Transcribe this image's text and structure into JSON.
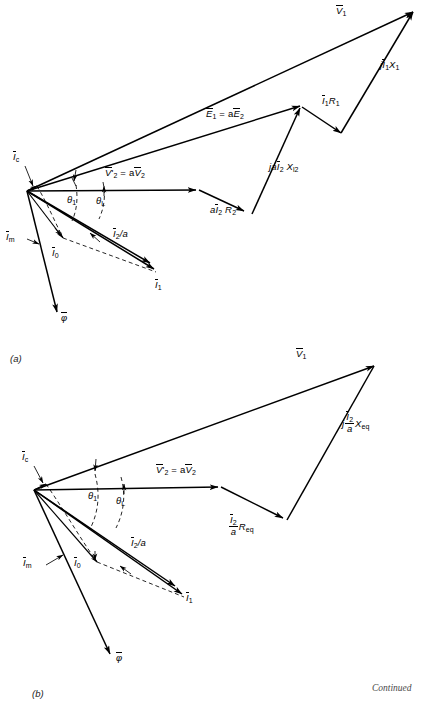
{
  "figure": {
    "background_color": "#ffffff",
    "line_color": "#000000",
    "width": 423,
    "height": 707,
    "continued_note": "Continued"
  },
  "captions": {
    "a": "(a)",
    "b": "(b)"
  },
  "diagram_a": {
    "caption": "(a)",
    "labels": {
      "v1": "V̄1",
      "ji1x1": "jĪ1X1",
      "i1r1": "Ī1R1",
      "e1_ae2": "Ē₁ = aĒ₂",
      "jai2xl2": "jaĪ₂ Xₗ₂",
      "ai2r2": "aĪ₂R₂",
      "v2p_av2": "V̄'₂ = aV̄₂",
      "ic": "Īc",
      "im": "Īm",
      "i0": "Ī0",
      "i1": "Ī1",
      "i2_over_a": "Ī₂/a",
      "theta1": "θ1",
      "thetaL": "θL",
      "phi": "φ̄"
    }
  },
  "diagram_b": {
    "caption": "(b)",
    "labels": {
      "v1": "V̄1",
      "j_i2_a_xeq": "j (Ī₂/a) Xeq",
      "i2_a_req": "(Ī₂/a) Req",
      "v2p_av2": "V̄'₂ = aV̄₂",
      "ic": "Īc",
      "im": "Īm",
      "i0": "Ī0",
      "i1": "Ī1",
      "i2_over_a": "Ī₂/a",
      "theta1": "θ1",
      "thetaL": "θL",
      "phi": "φ̄"
    }
  },
  "label_text": {
    "a_v1": "V",
    "a_v1_sub": "1",
    "a_ji1x1_j": "j",
    "a_ji1x1_i": "I",
    "a_ji1x1_isub": "1",
    "a_ji1x1_x": "X",
    "a_ji1x1_xsub": "1",
    "a_i1r1_i": "I",
    "a_i1r1_isub": "1",
    "a_i1r1_r": "R",
    "a_i1r1_rsub": "1",
    "a_e1_e": "E",
    "a_e1_esub": "1",
    "a_e1_eq": " = a",
    "a_e1_e2": "E",
    "a_e1_e2sub": "2",
    "a_xl2_ja": "ja",
    "a_xl2_i": "I",
    "a_xl2_isub": "2",
    "a_xl2_x": " X",
    "a_xl2_xsub": "l2",
    "a_r2_a": "a",
    "a_r2_i": "I",
    "a_r2_isub": "2",
    "a_r2_r": " R",
    "a_r2_rsub": "2",
    "a_v2p_v": "V",
    "a_v2p_prime": "'",
    "a_v2p_sub": "2",
    "a_v2p_eq": " = a",
    "a_v2p_v2": "V",
    "a_v2p_v2sub": "2",
    "a_ic_i": "I",
    "a_ic_sub": "c",
    "a_im_i": "I",
    "a_im_sub": "m",
    "a_i0_i": "I",
    "a_i0_sub": "0",
    "a_i1_i": "I",
    "a_i1_sub": "1",
    "a_i2a_i": "I",
    "a_i2a_sub": "2",
    "a_i2a_tail": "/a",
    "a_theta1": "θ",
    "a_theta1_sub": "1",
    "a_thetaL": "θ",
    "a_thetaL_sub": "L",
    "a_phi": "φ",
    "b_xeq_j": "j",
    "b_xeq_num": "I",
    "b_xeq_numsub": "2",
    "b_xeq_den": "a",
    "b_xeq_x": "X",
    "b_xeq_xsub": "eq",
    "b_req_num": "I",
    "b_req_numsub": "2",
    "b_req_den": "a",
    "b_req_r": "R",
    "b_req_rsub": "eq"
  }
}
